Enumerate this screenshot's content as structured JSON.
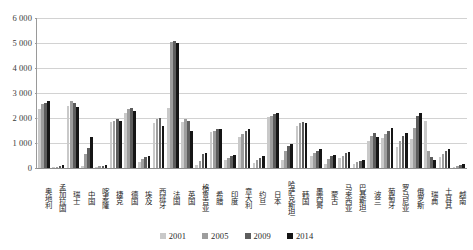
{
  "chart_data": {
    "type": "bar",
    "title": "",
    "xlabel": "",
    "ylabel": "",
    "ylim": [
      0,
      6000
    ],
    "ytick_labels": [
      "6 000",
      "5 000",
      "4 000",
      "3 000",
      "2 000",
      "1 000",
      "0"
    ],
    "ytick_values": [
      6000,
      5000,
      4000,
      3000,
      2000,
      1000,
      0
    ],
    "grid": true,
    "legend_position": "bottom",
    "categories": [
      "奥地利",
      "孟加拉国",
      "瑞士",
      "中国",
      "喀麦隆",
      "捷克",
      "德国",
      "埃及",
      "西班牙",
      "法国",
      "英国",
      "格鲁吉亚",
      "希腊",
      "印度",
      "意大利",
      "约旦",
      "日本",
      "哈萨克斯坦",
      "韩国",
      "墨西哥",
      "蒙古",
      "马来西亚",
      "巴基斯坦",
      "波兰",
      "葡萄牙",
      "罗马尼亚",
      "俄罗斯",
      "瑞典",
      "土耳其",
      "越南"
    ],
    "series": [
      {
        "name": "2001",
        "color": "#c9c9c9",
        "values": [
          2350,
          30,
          2500,
          90,
          60,
          1850,
          2200,
          250,
          1800,
          2400,
          1850,
          120,
          1450,
          330,
          1250,
          200,
          2050,
          330,
          1700,
          480,
          170,
          420,
          180,
          1100,
          1200,
          830,
          1150,
          1900,
          430,
          60
        ]
      },
      {
        "name": "2005",
        "color": "#9d9d9d",
        "values": [
          2550,
          40,
          2700,
          550,
          70,
          1900,
          2350,
          380,
          1950,
          5050,
          1950,
          300,
          1500,
          400,
          1350,
          330,
          2100,
          700,
          1800,
          620,
          350,
          500,
          250,
          1300,
          1350,
          1100,
          1600,
          700,
          550,
          90
        ]
      },
      {
        "name": "2009",
        "color": "#5d5d5d",
        "values": [
          2600,
          70,
          2600,
          800,
          100,
          1950,
          2400,
          430,
          2000,
          5100,
          1900,
          560,
          1550,
          480,
          1500,
          420,
          2150,
          900,
          1850,
          700,
          480,
          600,
          300,
          1400,
          1500,
          1300,
          2100,
          450,
          700,
          130
        ]
      },
      {
        "name": "2014",
        "color": "#151515",
        "values": [
          2700,
          110,
          2450,
          1250,
          140,
          1900,
          2300,
          470,
          1700,
          5000,
          1500,
          620,
          1580,
          520,
          1550,
          500,
          2200,
          950,
          1800,
          780,
          530,
          640,
          340,
          1250,
          1600,
          1400,
          2200,
          330,
          750,
          170
        ]
      }
    ]
  },
  "legend": {
    "items": [
      {
        "label": "2001",
        "color": "#c9c9c9"
      },
      {
        "label": "2005",
        "color": "#9d9d9d"
      },
      {
        "label": "2009",
        "color": "#5d5d5d"
      },
      {
        "label": "2014",
        "color": "#151515"
      }
    ]
  }
}
